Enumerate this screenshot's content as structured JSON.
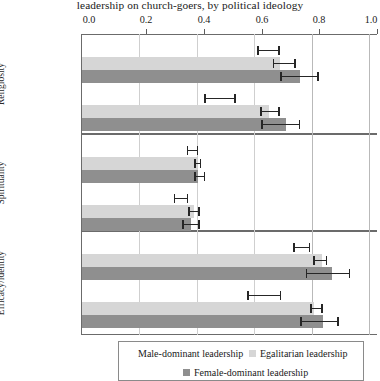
{
  "chart_data": {
    "type": "bar",
    "orientation": "horizontal",
    "title": "leadership on church-goers, by political ideology",
    "xlabel": "",
    "ylabel": "",
    "xlim": [
      0.0,
      1.0
    ],
    "xticks": [
      "0.0",
      "0.2",
      "0.4",
      "0.6",
      "0.8",
      "1.0"
    ],
    "xtick_values": [
      0.0,
      0.2,
      0.4,
      0.6,
      0.8,
      1.0
    ],
    "grid": "vertical",
    "legend_position": "bottom",
    "panels": [
      "Religiosity",
      "Spirituality",
      "Efficacy/identity"
    ],
    "groups": [
      "Conservatives",
      "Liberals"
    ],
    "series": [
      {
        "name": "Male-dominant leadership",
        "color": "#ffffff",
        "values": [
          [
            0.0,
            0.0
          ],
          [
            0.0,
            0.0
          ],
          [
            0.0,
            0.0
          ]
        ],
        "estimates": [
          [
            0.65,
            0.48
          ],
          [
            0.385,
            0.345
          ],
          [
            0.765,
            0.635
          ]
        ],
        "ci_low": [
          [
            0.61,
            0.425
          ],
          [
            0.365,
            0.32
          ],
          [
            0.735,
            0.575
          ]
        ],
        "ci_high": [
          [
            0.69,
            0.535
          ],
          [
            0.405,
            0.37
          ],
          [
            0.795,
            0.695
          ]
        ]
      },
      {
        "name": "Egalitarian leadership",
        "color": "#d6d6d6",
        "values": [
          [
            0.69,
            0.65
          ],
          [
            0.4,
            0.39
          ],
          [
            0.835,
            0.81
          ]
        ],
        "ci_low": [
          [
            0.665,
            0.62
          ],
          [
            0.39,
            0.37
          ],
          [
            0.805,
            0.795
          ]
        ],
        "ci_high": [
          [
            0.745,
            0.69
          ],
          [
            0.415,
            0.41
          ],
          [
            0.855,
            0.84
          ]
        ]
      },
      {
        "name": "Female-dominant leadership",
        "color": "#8f8f8f",
        "values": [
          [
            0.76,
            0.71
          ],
          [
            0.405,
            0.38
          ],
          [
            0.87,
            0.84
          ]
        ],
        "ci_low": [
          [
            0.69,
            0.625
          ],
          [
            0.39,
            0.35
          ],
          [
            0.78,
            0.76
          ]
        ],
        "ci_high": [
          [
            0.825,
            0.76
          ],
          [
            0.43,
            0.41
          ],
          [
            0.935,
            0.895
          ]
        ]
      }
    ]
  },
  "title": {
    "text": "leadership on church-goers, by political ideology"
  },
  "axis": {
    "tick_0": "0.0",
    "tick_1": "0.2",
    "tick_2": "0.4",
    "tick_3": "0.6",
    "tick_4": "0.8",
    "tick_5": "1.0"
  },
  "panels": {
    "p0_label": "Religiosity",
    "p1_label": "Spirituality",
    "p2_label": "Efficacy/identity"
  },
  "groups": {
    "conservatives": "Conservatives",
    "liberals": "Liberals"
  },
  "legend": {
    "male": "Male-dominant leadership",
    "egalitarian": "Egalitarian leadership",
    "female": "Female-dominant leadership"
  },
  "colors": {
    "egalitarian": "#d6d6d6",
    "female": "#8f8f8f",
    "male": "#ffffff",
    "error": "#262626",
    "grid": "#cfcfcf",
    "frame": "#6b6b6b"
  }
}
